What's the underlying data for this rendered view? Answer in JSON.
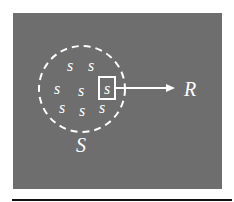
{
  "diagram": {
    "background_color": "#6e6e6e",
    "foreground_color": "#ffffff",
    "rule_color": "#111111",
    "set": {
      "label": "S",
      "boundary_style": "dashed-circle",
      "elements": [
        "s",
        "s",
        "s",
        "s",
        "s",
        "s",
        "s",
        "s"
      ],
      "selected_element_index": 4
    },
    "mapping": {
      "target_label": "R",
      "arrow": "right"
    }
  }
}
